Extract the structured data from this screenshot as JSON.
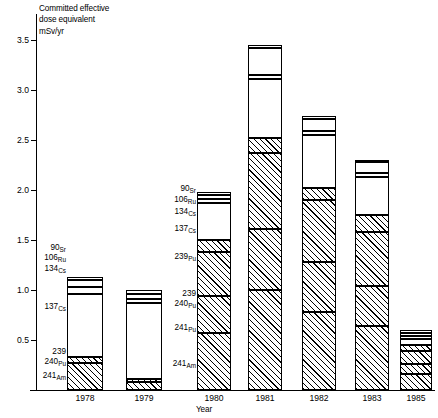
{
  "chart_data": {
    "type": "bar",
    "subtype": "stacked-bar",
    "title": "",
    "ylabel_lines": [
      "Committed effective",
      "dose equivalent",
      "mSv/yr"
    ],
    "ylabel": "Committed effective dose equivalent mSv/yr",
    "xlabel": "Year",
    "categories": [
      "1978",
      "1979",
      "1980",
      "1981",
      "1982",
      "1983",
      "1985"
    ],
    "ylim": [
      0,
      3.6
    ],
    "yticks": [
      0.5,
      1.0,
      1.5,
      2.0,
      2.5,
      3.0,
      3.5
    ],
    "ytick_labels": [
      "0.5",
      "1.0",
      "1.5",
      "2.0",
      "2.5",
      "3.0",
      "3.5"
    ],
    "grid": false,
    "legend": "inline-callout-labels",
    "series": [
      {
        "name": "241Am",
        "label_mass": "241",
        "label_element": "Am",
        "fill": "hatched",
        "values": [
          0.27,
          0.08,
          0.57,
          1.0,
          0.78,
          0.64,
          0.16
        ]
      },
      {
        "name": "241Pu",
        "label_mass": "241",
        "label_element": "Pu",
        "fill": "hatched",
        "values": [
          0.0,
          0.0,
          0.37,
          0.61,
          0.5,
          0.4,
          0.1
        ]
      },
      {
        "name": "239,240Pu",
        "label_mass": "239 240",
        "label_element": "Pu",
        "fill": "hatched",
        "values": [
          0.06,
          0.03,
          0.44,
          0.76,
          0.62,
          0.54,
          0.13
        ]
      },
      {
        "name": "239Pu",
        "label_mass": "239",
        "label_element": "Pu",
        "fill": "hatched",
        "values": [
          0.0,
          0.0,
          0.12,
          0.15,
          0.12,
          0.17,
          0.06
        ]
      },
      {
        "name": "137Cs",
        "label_mass": "137",
        "label_element": "Cs",
        "fill": "white",
        "values": [
          0.63,
          0.76,
          0.37,
          0.59,
          0.53,
          0.38,
          0.06
        ]
      },
      {
        "name": "134Cs",
        "label_mass": "134",
        "label_element": "Cs",
        "fill": "white",
        "values": [
          0.07,
          0.04,
          0.04,
          0.04,
          0.04,
          0.04,
          0.03
        ]
      },
      {
        "name": "106Ru",
        "label_mass": "106",
        "label_element": "Ru",
        "fill": "white",
        "values": [
          0.07,
          0.05,
          0.04,
          0.27,
          0.12,
          0.11,
          0.03
        ]
      },
      {
        "name": "90Sr",
        "label_mass": "90",
        "label_element": "Sr",
        "fill": "white",
        "values": [
          0.03,
          0.04,
          0.03,
          0.03,
          0.03,
          0.02,
          0.03
        ]
      }
    ],
    "totals": [
      1.13,
      1.0,
      1.98,
      3.45,
      2.74,
      2.3,
      0.6
    ]
  },
  "callouts_left": [
    {
      "mass": "90",
      "element": "Sr"
    },
    {
      "mass": "106",
      "element": "Ru"
    },
    {
      "mass": "134",
      "element": "Cs"
    },
    {
      "mass": "137",
      "element": "Cs"
    },
    {
      "mass": "239",
      "element": ""
    },
    {
      "mass": "240",
      "element": "Pu"
    },
    {
      "mass": "241",
      "element": "Am"
    }
  ],
  "callouts_mid": [
    {
      "mass": "90",
      "element": "Sr"
    },
    {
      "mass": "106",
      "element": "Ru"
    },
    {
      "mass": "134",
      "element": "Cs"
    },
    {
      "mass": "137",
      "element": "Cs"
    },
    {
      "mass": "239",
      "element": "Pu"
    },
    {
      "mass": "239",
      "element": ""
    },
    {
      "mass": "240",
      "element": "Pu"
    },
    {
      "mass": "241",
      "element": "Pu"
    },
    {
      "mass": "241",
      "element": "Am"
    }
  ]
}
